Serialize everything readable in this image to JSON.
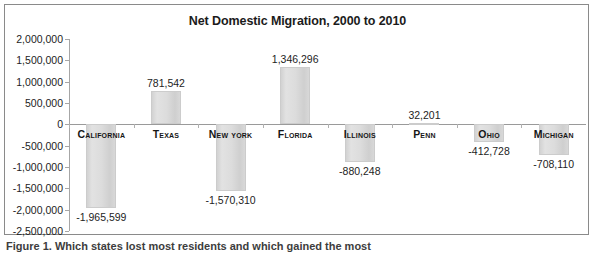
{
  "figure": {
    "caption": "Figure 1. Which states lost most residents and which gained the most"
  },
  "chart_data": {
    "type": "bar",
    "title": "Net Domestic Migration, 2000 to 2010",
    "xlabel": "",
    "ylabel": "",
    "grid": false,
    "legend": "none",
    "ylim": [
      -2500000,
      2000000
    ],
    "ytick_step": 500000,
    "ytick_labels": [
      "2,000,000",
      "1,500,000",
      "1,000,000",
      "500,000",
      "0",
      "-500,000",
      "-1,000,000",
      "-1,500,000",
      "-2,000,000",
      "-2,500,000"
    ],
    "ytick_values": [
      2000000,
      1500000,
      1000000,
      500000,
      0,
      -500000,
      -1000000,
      -1500000,
      -2000000,
      -2500000
    ],
    "categories": [
      "California",
      "Texas",
      "New York",
      "Florida",
      "Illinois",
      "Penn",
      "Ohio",
      "Michigan"
    ],
    "values": [
      -1965599,
      781542,
      -1570310,
      1346296,
      -880248,
      32201,
      -412728,
      -708110
    ],
    "data_labels": [
      "-1,965,599",
      "781,542",
      "-1,570,310",
      "1,346,296",
      "-880,248",
      "32,201",
      "-412,728",
      "-708,110"
    ],
    "bar_color": "#d9d9d9"
  }
}
